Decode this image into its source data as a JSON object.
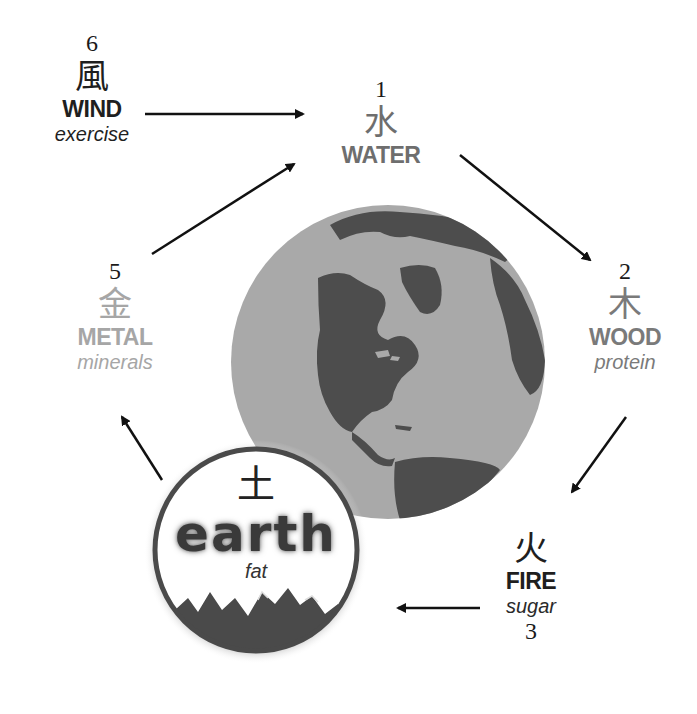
{
  "diagram": {
    "type": "cycle",
    "colors": {
      "dark_text": "#1f1f1f",
      "mid_gray_text": "#6e6e6e",
      "light_gray_text": "#a6a6a6",
      "ocean": "#a9a9a9",
      "land": "#4d4d4d",
      "arrow": "#111111"
    },
    "elements": [
      {
        "id": "water",
        "order": "1",
        "kanji": "水",
        "name": "WATER",
        "food": ""
      },
      {
        "id": "wood",
        "order": "2",
        "kanji": "木",
        "name": "WOOD",
        "food": "protein"
      },
      {
        "id": "fire",
        "order": "3",
        "kanji": "火",
        "name": "FIRE",
        "food": "sugar"
      },
      {
        "id": "earth",
        "order": "4",
        "kanji": "土",
        "name": "earth",
        "food": "fat"
      },
      {
        "id": "metal",
        "order": "5",
        "kanji": "金",
        "name": "METAL",
        "food": "minerals"
      },
      {
        "id": "wind",
        "order": "6",
        "kanji": "風",
        "name": "WIND",
        "food": "exercise"
      }
    ],
    "arrows": [
      {
        "from": "wind",
        "to": "water"
      },
      {
        "from": "water",
        "to": "wood"
      },
      {
        "from": "wood",
        "to": "fire"
      },
      {
        "from": "fire",
        "to": "earth"
      },
      {
        "from": "earth",
        "to": "metal"
      },
      {
        "from": "metal",
        "to": "water"
      }
    ],
    "center_image": "globe-americas"
  }
}
